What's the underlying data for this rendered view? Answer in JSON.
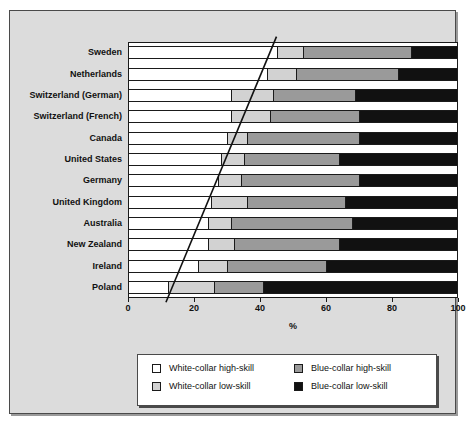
{
  "chart_data": {
    "type": "bar",
    "orientation": "horizontal",
    "stacked": true,
    "title": "",
    "xlabel": "%",
    "ylabel": "",
    "xlim": [
      0,
      100
    ],
    "xticks": [
      0,
      20,
      40,
      60,
      80,
      100
    ],
    "xticklabels": [
      "0",
      "20",
      "40",
      "60",
      "80",
      "100"
    ],
    "grid": false,
    "legend_position": "bottom",
    "categories": [
      "Sweden",
      "Netherlands",
      "Switzerland (German)",
      "Switzerland (French)",
      "Canada",
      "United States",
      "Germany",
      "United Kingdom",
      "Australia",
      "New Zealand",
      "Ireland",
      "Poland"
    ],
    "series": [
      {
        "name": "White-collar high-skill",
        "color": "#ffffff",
        "values": [
          45,
          42,
          31,
          31,
          30,
          28,
          27,
          25,
          24,
          24,
          21,
          12
        ]
      },
      {
        "name": "White-collar low-skill",
        "color": "#d2d2d2",
        "values": [
          8,
          9,
          13,
          12,
          6,
          7,
          7,
          11,
          7,
          8,
          9,
          14
        ]
      },
      {
        "name": "Blue-collar high-skill",
        "color": "#9a9a9a",
        "values": [
          33,
          31,
          25,
          27,
          34,
          29,
          36,
          30,
          37,
          32,
          30,
          15
        ]
      },
      {
        "name": "Blue-collar low-skill",
        "color": "#111111",
        "values": [
          14,
          18,
          31,
          30,
          30,
          36,
          30,
          34,
          32,
          36,
          40,
          59
        ]
      }
    ],
    "annotations": [
      {
        "type": "reference-line",
        "name": "diagonal-trend-line",
        "from": {
          "x": 45,
          "category_index": 0
        },
        "to": {
          "x": 11.5,
          "category_index": 11
        }
      }
    ]
  },
  "legend": {
    "items": [
      {
        "label": "White-collar high-skill",
        "swatch": "wh"
      },
      {
        "label": "Blue-collar high-skill",
        "swatch": "bh"
      },
      {
        "label": "White-collar low-skill",
        "swatch": "wl"
      },
      {
        "label": "Blue-collar low-skill",
        "swatch": "bl"
      }
    ]
  }
}
